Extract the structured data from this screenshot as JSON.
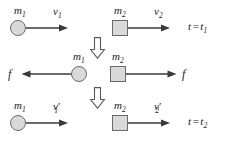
{
  "diagram": {
    "width": 231,
    "height": 146,
    "colors": {
      "body_fill": "#d9d9d9",
      "body_stroke": "#6b6b6b",
      "arrow": "#3a3a3a",
      "text": "#1a1a1a",
      "background": "#ffffff"
    }
  },
  "rows": {
    "before": {
      "time_label": {
        "var": "t",
        "equals": "=",
        "value": "t",
        "value_sub": "1",
        "full": "t = t1"
      },
      "left": {
        "mass": {
          "symbol": "m",
          "sub": "1"
        },
        "velocity": {
          "symbol": "v",
          "sub": "1",
          "prime": ""
        },
        "shape": "circle",
        "arrow_direction": "right"
      },
      "right": {
        "mass": {
          "symbol": "m",
          "sub": "2"
        },
        "velocity": {
          "symbol": "v",
          "sub": "2",
          "prime": ""
        },
        "shape": "square",
        "arrow_direction": "right"
      }
    },
    "during": {
      "left": {
        "mass": {
          "symbol": "m",
          "sub": "1"
        },
        "force": {
          "symbol": "f"
        },
        "shape": "circle",
        "arrow_direction": "left"
      },
      "right": {
        "mass": {
          "symbol": "m",
          "sub": "2"
        },
        "force": {
          "symbol": "f"
        },
        "shape": "square",
        "arrow_direction": "right"
      }
    },
    "after": {
      "time_label": {
        "var": "t",
        "equals": "=",
        "value": "t",
        "value_sub": "2",
        "full": "t = t2"
      },
      "left": {
        "mass": {
          "symbol": "m",
          "sub": "1"
        },
        "velocity": {
          "symbol": "v",
          "sub": "1",
          "prime": "′"
        },
        "shape": "circle",
        "arrow_direction": "right"
      },
      "right": {
        "mass": {
          "symbol": "m",
          "sub": "2"
        },
        "velocity": {
          "symbol": "v",
          "sub": "2",
          "prime": "′"
        },
        "shape": "square",
        "arrow_direction": "right"
      }
    }
  },
  "transitions": [
    {
      "name": "flow-arrow-1",
      "direction": "down"
    },
    {
      "name": "flow-arrow-2",
      "direction": "down"
    }
  ]
}
